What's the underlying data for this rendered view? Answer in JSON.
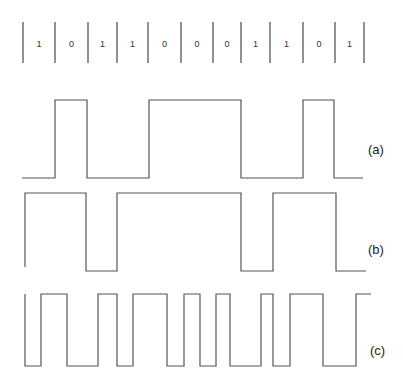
{
  "diagram": {
    "title": "",
    "bits": [
      "1",
      "0",
      "1",
      "1",
      "0",
      "0",
      "0",
      "1",
      "1",
      "0",
      "1"
    ],
    "bit_separators_x": [
      23,
      55,
      88,
      117,
      148,
      181,
      213,
      241,
      270,
      303,
      335,
      364
    ],
    "bit_row": {
      "y_top": 22,
      "y_bottom": 63,
      "text_y": 47
    },
    "waveforms": [
      {
        "id": "a",
        "label": "(a)",
        "label_pos": [
          368,
          154
        ],
        "high_y": 100,
        "low_y": 178,
        "points": [
          [
            22,
            178
          ],
          [
            55,
            178
          ],
          [
            55,
            100
          ],
          [
            87,
            100
          ],
          [
            87,
            178
          ],
          [
            149,
            178
          ],
          [
            149,
            100
          ],
          [
            241,
            100
          ],
          [
            241,
            178
          ],
          [
            303,
            178
          ],
          [
            303,
            100
          ],
          [
            334,
            100
          ],
          [
            334,
            178
          ],
          [
            363,
            178
          ]
        ]
      },
      {
        "id": "b",
        "label": "(b)",
        "label_pos": [
          368,
          254
        ],
        "high_y": 193,
        "low_y": 271,
        "points": [
          [
            25,
            267
          ],
          [
            25,
            193
          ],
          [
            86,
            193
          ],
          [
            86,
            271
          ],
          [
            117,
            271
          ],
          [
            117,
            193
          ],
          [
            241,
            193
          ],
          [
            241,
            271
          ],
          [
            273,
            271
          ],
          [
            273,
            193
          ],
          [
            336,
            193
          ],
          [
            336,
            271
          ],
          [
            366,
            271
          ]
        ]
      },
      {
        "id": "c",
        "label": "(c)",
        "label_pos": [
          370,
          355
        ],
        "high_y": 294,
        "low_y": 366,
        "points": [
          [
            25,
            294
          ],
          [
            25,
            366
          ],
          [
            41,
            366
          ],
          [
            41,
            294
          ],
          [
            67,
            294
          ],
          [
            67,
            366
          ],
          [
            98,
            366
          ],
          [
            98,
            294
          ],
          [
            117,
            294
          ],
          [
            117,
            366
          ],
          [
            133,
            366
          ],
          [
            133,
            294
          ],
          [
            167,
            294
          ],
          [
            167,
            366
          ],
          [
            184,
            366
          ],
          [
            184,
            294
          ],
          [
            200,
            294
          ],
          [
            200,
            366
          ],
          [
            216,
            366
          ],
          [
            216,
            294
          ],
          [
            230,
            294
          ],
          [
            230,
            366
          ],
          [
            261,
            366
          ],
          [
            261,
            294
          ],
          [
            273,
            294
          ],
          [
            273,
            366
          ],
          [
            290,
            366
          ],
          [
            290,
            294
          ],
          [
            323,
            294
          ],
          [
            323,
            366
          ],
          [
            356,
            366
          ],
          [
            356,
            294
          ],
          [
            371,
            294
          ]
        ]
      }
    ],
    "colors": {
      "line": "#555555",
      "text": "#222222",
      "background": "#ffffff"
    }
  }
}
